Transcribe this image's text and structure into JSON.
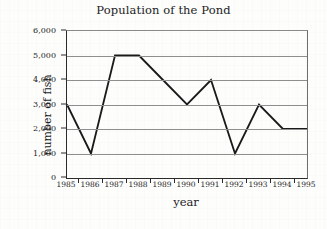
{
  "chart_data": {
    "type": "line",
    "title": "Population of the Pond",
    "xlabel": "year",
    "ylabel": "number of fish",
    "categories": [
      "1985",
      "1986",
      "1987",
      "1988",
      "1989",
      "1990",
      "1991",
      "1992",
      "1993",
      "1994",
      "1995"
    ],
    "values": [
      3000,
      1000,
      5000,
      5000,
      4000,
      3000,
      4000,
      1000,
      3000,
      2000,
      2000
    ],
    "series": [
      {
        "name": "number of fish",
        "values": [
          3000,
          1000,
          5000,
          5000,
          4000,
          3000,
          4000,
          1000,
          3000,
          2000,
          2000
        ]
      }
    ],
    "ylim": [
      0,
      6000
    ],
    "ytick_values": [
      0,
      1000,
      2000,
      3000,
      4000,
      5000,
      6000
    ],
    "ytick_labels": [
      "0",
      "1,000",
      "2,000",
      "3,000",
      "4,000",
      "5,000",
      "6,000"
    ],
    "grid": true,
    "grid_axis": "y",
    "legend": false,
    "legend_position": "none",
    "line_color": "#1a1a1a",
    "grid_color": "#8e8e8e",
    "axis_color": "#2b2b2b",
    "background_color": "#fdfdfc",
    "markers": false
  }
}
